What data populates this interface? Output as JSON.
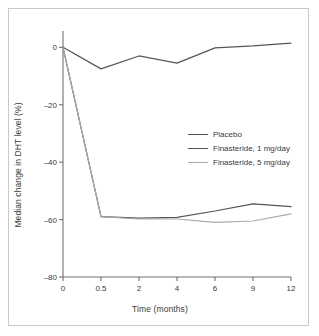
{
  "chart_data": {
    "type": "line",
    "title": "",
    "xlabel": "Time (months)",
    "ylabel": "Median change in DHT level (%)",
    "categories": [
      "0",
      "0.5",
      "2",
      "4",
      "6",
      "9",
      "12"
    ],
    "x_tick_labels": [
      "0",
      "0.5",
      "2",
      "4",
      "6",
      "9",
      "12"
    ],
    "y_tick_labels": [
      "0",
      "–20",
      "–40",
      "–60",
      "–80"
    ],
    "y_tick_values": [
      0,
      -20,
      -40,
      -60,
      -80
    ],
    "ylim": [
      -80,
      5
    ],
    "grid": false,
    "legend_position": "center-right",
    "series": [
      {
        "name": "Placebo",
        "color": "#555555",
        "width": 1.2,
        "values": [
          0,
          -7.5,
          -3,
          -5.5,
          -0.2,
          0.5,
          1.5
        ]
      },
      {
        "name": "Finasteride, 1 mg/day",
        "color": "#555555",
        "width": 1.2,
        "values": [
          0,
          -59,
          -59.5,
          -59.2,
          -57,
          -54.5,
          -55.5
        ]
      },
      {
        "name": "Finasteride, 5 mg/day",
        "color": "#aaaaaa",
        "width": 1.2,
        "values": [
          0,
          -59,
          -59.8,
          -59.8,
          -61,
          -60.5,
          -58
        ]
      }
    ]
  },
  "axis": {
    "line_color": "#707070",
    "x_title": "Time (months)",
    "y_title": "Median change in DHT level (%)"
  },
  "frame": {
    "border_color": "#c9c9c9",
    "background": "#ffffff"
  }
}
